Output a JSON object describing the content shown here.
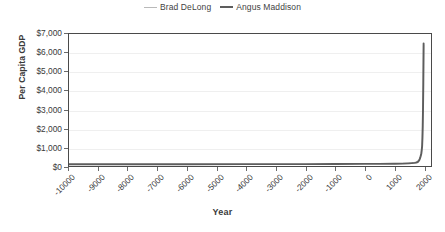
{
  "chart_data": {
    "type": "line",
    "title": "",
    "xlabel": "Year",
    "ylabel": "Per Capita GDP",
    "xlim": [
      -10000,
      2250
    ],
    "ylim": [
      0,
      7000
    ],
    "grid": true,
    "legend_position": "top-center",
    "x_tick_labels": [
      "-10000",
      "-9000",
      "-8000",
      "-7000",
      "-6000",
      "-5000",
      "-4000",
      "-3000",
      "-2000",
      "-1000",
      "0",
      "1000",
      "2000"
    ],
    "x_tick_values": [
      -10000,
      -9000,
      -8000,
      -7000,
      -6000,
      -5000,
      -4000,
      -3000,
      -2000,
      -1000,
      0,
      1000,
      2000
    ],
    "y_tick_labels": [
      "$0",
      "$1,000",
      "$2,000",
      "$3,000",
      "$4,000",
      "$5,000",
      "$6,000",
      "$7,000"
    ],
    "y_tick_values": [
      0,
      1000,
      2000,
      3000,
      4000,
      5000,
      6000,
      7000
    ],
    "series": [
      {
        "name": "Brad DeLong",
        "color": "#b9b9b9",
        "x": [
          1000,
          1300,
          1500,
          1600,
          1700,
          1750,
          1800,
          1850,
          1875,
          1900,
          1925,
          1950,
          1960,
          1970,
          1980,
          1990,
          2000
        ],
        "values": [
          130,
          140,
          155,
          175,
          195,
          215,
          250,
          330,
          420,
          560,
          720,
          1100,
          1500,
          2200,
          3100,
          4400,
          6400
        ]
      },
      {
        "name": "Angus Maddison",
        "color": "#5d5d5d",
        "x": [
          -10000,
          -8000,
          -6000,
          -4000,
          -2000,
          -1000,
          0,
          500,
          1000,
          1300,
          1500,
          1600,
          1700,
          1750,
          1800,
          1850,
          1875,
          1900,
          1925,
          1950,
          1960,
          1970,
          1980,
          1990,
          2000
        ],
        "values": [
          90,
          92,
          95,
          98,
          102,
          105,
          110,
          112,
          118,
          125,
          140,
          150,
          165,
          180,
          210,
          300,
          390,
          520,
          680,
          1050,
          1450,
          2150,
          3050,
          4350,
          6500
        ]
      }
    ]
  },
  "legend": {
    "entries": [
      {
        "label": "Brad DeLong"
      },
      {
        "label": "Angus Maddison"
      }
    ]
  }
}
